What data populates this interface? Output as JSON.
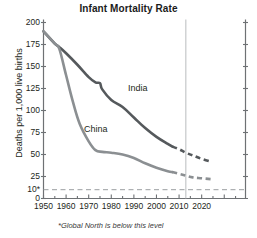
{
  "chart_data": {
    "type": "line",
    "title": "Infant Mortality Rate",
    "xlabel": "",
    "ylabel": "Deaths per 1,000 live births",
    "xlim": [
      1950,
      2025
    ],
    "ylim": [
      0,
      200
    ],
    "grid": false,
    "legend_position": "inline-labels",
    "ytick_labels": [
      "200",
      "175",
      "150",
      "125",
      "100",
      "75",
      "50",
      "25",
      "10*",
      "0"
    ],
    "ytick_values": [
      200,
      175,
      150,
      125,
      100,
      75,
      50,
      25,
      10,
      0
    ],
    "xtick_labels": [
      "1950",
      "1960",
      "1970",
      "1980",
      "1990",
      "2000",
      "2010",
      "2020"
    ],
    "xtick_values": [
      1950,
      1960,
      1970,
      1980,
      1990,
      2000,
      2010,
      2020
    ],
    "xminor_step": 5,
    "annotations": [
      {
        "name": "global-north-threshold",
        "type": "hline",
        "value": 10,
        "style": "dashed",
        "label": "10*"
      },
      {
        "name": "projection-divider",
        "type": "vline",
        "value": 2013,
        "style": "solid"
      }
    ],
    "footnote": "*Global North is below this level",
    "series": [
      {
        "name": "India",
        "color": "#55595c",
        "label_x": 1988,
        "label_y": 132,
        "solid": {
          "x": [
            1950,
            1955,
            1957,
            1960,
            1965,
            1970,
            1973,
            1975,
            1976,
            1980,
            1985,
            1990,
            1995,
            2000,
            2005,
            2007
          ],
          "y": [
            190,
            176,
            172,
            165,
            152,
            138,
            132,
            131,
            124,
            112,
            104,
            92,
            80,
            70,
            62,
            59
          ]
        },
        "dashed": {
          "x": [
            2007,
            2010,
            2013,
            2016,
            2020,
            2024
          ],
          "y": [
            59,
            56,
            52,
            49,
            45,
            42
          ]
        }
      },
      {
        "name": "China",
        "color": "#8b8f92",
        "label_x": 1972,
        "label_y": 85,
        "solid": {
          "x": [
            1950,
            1955,
            1957,
            1960,
            1963,
            1966,
            1970,
            1973,
            1976,
            1980,
            1985,
            1990,
            1995,
            2000,
            2005,
            2007
          ],
          "y": [
            190,
            176,
            170,
            140,
            110,
            85,
            65,
            55,
            53,
            52,
            50,
            46,
            40,
            35,
            31,
            30
          ]
        },
        "dashed": {
          "x": [
            2007,
            2010,
            2013,
            2016,
            2020,
            2024
          ],
          "y": [
            30,
            28,
            26,
            24,
            23,
            22
          ]
        }
      }
    ]
  },
  "title": "Infant Mortality Rate",
  "axis": {
    "y_title": "Deaths per 1,000 live births"
  },
  "labels": {
    "india": "India",
    "china": "China"
  },
  "yticks": [
    {
      "label": "200"
    },
    {
      "label": "175"
    },
    {
      "label": "150"
    },
    {
      "label": "125"
    },
    {
      "label": "100"
    },
    {
      "label": "75"
    },
    {
      "label": "50"
    },
    {
      "label": "25"
    },
    {
      "label": "10*"
    },
    {
      "label": "0"
    }
  ],
  "xticks": [
    {
      "label": "1950"
    },
    {
      "label": "1960"
    },
    {
      "label": "1970"
    },
    {
      "label": "1980"
    },
    {
      "label": "1990"
    },
    {
      "label": "2000"
    },
    {
      "label": "2010"
    },
    {
      "label": "2020"
    }
  ],
  "footnote": "*Global North is below this level",
  "colors": {
    "india_line": "#55595c",
    "china_line": "#8b8f92",
    "axis": "#6e7174",
    "text": "#231f20"
  }
}
